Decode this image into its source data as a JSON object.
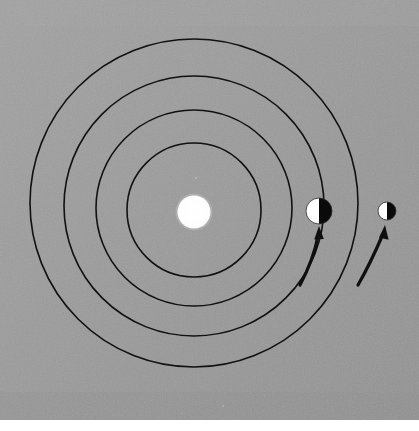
{
  "figure": {
    "type": "astronomical-orbit-diagram",
    "canvas": {
      "width": 419,
      "height": 431
    },
    "background": {
      "plate_color": "#9b9b9b",
      "plate_rect": {
        "x": 0,
        "y": 0,
        "width": 419,
        "height": 420
      },
      "margin_color": "#ffffff",
      "noise": "film-grain"
    },
    "line_color": "#111111",
    "body_light_color": "#ffffff",
    "body_dark_color": "#0a0a0a"
  },
  "sun": {
    "name": "sun",
    "cx": 194,
    "cy": 212,
    "r": 16,
    "fill": "#ffffff",
    "label": ""
  },
  "orbits": [
    {
      "name": "orbit-1-innermost",
      "cx": 194,
      "cy": 210,
      "r": 67,
      "stroke_width": 1.6
    },
    {
      "name": "orbit-2",
      "cx": 194,
      "cy": 208,
      "r": 98,
      "stroke_width": 1.6
    },
    {
      "name": "orbit-3",
      "cx": 194,
      "cy": 206,
      "r": 130,
      "stroke_width": 1.6
    },
    {
      "name": "orbit-4-outermost",
      "cx": 194,
      "cy": 203,
      "r": 164,
      "stroke_width": 1.6
    }
  ],
  "planets": [
    {
      "name": "planet-inner",
      "cx": 319,
      "cy": 211,
      "r": 13,
      "lit_side": "left",
      "lit_color": "#ffffff",
      "dark_color": "#0a0a0a",
      "on_orbit": "orbit-3",
      "label": ""
    },
    {
      "name": "planet-outer",
      "cx": 387,
      "cy": 211,
      "r": 9,
      "lit_side": "left",
      "lit_color": "#ffffff",
      "dark_color": "#0a0a0a",
      "on_orbit": "orbit-4-outermost",
      "label": ""
    }
  ],
  "direction_arrows": [
    {
      "name": "direction-arrow-inner",
      "path": "M 300 285 C 309 268 315 252 318 236",
      "head_tip": {
        "x": 319,
        "y": 228
      },
      "head_angle_deg": -82,
      "stroke_width": 3.2,
      "sense": "counterclockwise"
    },
    {
      "name": "direction-arrow-outer",
      "path": "M 358 285 C 369 266 377 248 383 234",
      "head_tip": {
        "x": 385,
        "y": 227
      },
      "head_angle_deg": -73,
      "stroke_width": 3.2,
      "sense": "counterclockwise"
    }
  ],
  "annotations": {
    "text_items": []
  }
}
